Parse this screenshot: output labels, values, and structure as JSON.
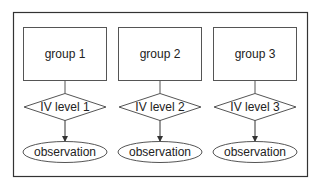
{
  "diagram": {
    "columns": [
      {
        "group": "group 1",
        "level": "IV level 1",
        "outcome": "observation"
      },
      {
        "group": "group 2",
        "level": "IV level 2",
        "outcome": "observation"
      },
      {
        "group": "group 3",
        "level": "IV level 3",
        "outcome": "observation"
      }
    ],
    "colors": {
      "stroke": "#444444",
      "frame": "#333333",
      "background": "#ffffff"
    }
  }
}
